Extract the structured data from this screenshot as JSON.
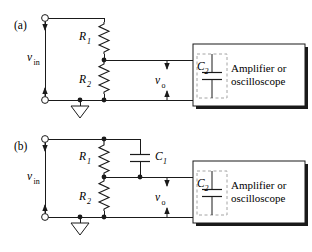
{
  "figure": {
    "background_color": "#ffffff",
    "line_color": "#1a1a1a",
    "dashed_color": "#9a9a9a"
  },
  "panels": [
    {
      "tag": "(a)",
      "description": "Resistive voltage divider feeding amplifier/oscilloscope with input capacitance C2",
      "input_label": "v",
      "input_sub": "in",
      "output_label": "v",
      "output_sub": "o",
      "resistors": [
        {
          "label": "R",
          "sub": "1"
        },
        {
          "label": "R",
          "sub": "2"
        }
      ],
      "capacitors": [
        {
          "label": "C",
          "sub": "2",
          "dashed": true
        }
      ],
      "instrument_line1": "Amplifier or",
      "instrument_line2": "oscilloscope",
      "ground": "ground-symbol"
    },
    {
      "tag": "(b)",
      "description": "Compensated voltage divider with C1 across R1 feeding amplifier/oscilloscope",
      "input_label": "v",
      "input_sub": "in",
      "output_label": "v",
      "output_sub": "o",
      "resistors": [
        {
          "label": "R",
          "sub": "1"
        },
        {
          "label": "R",
          "sub": "2"
        }
      ],
      "capacitors": [
        {
          "label": "C",
          "sub": "1",
          "dashed": false
        },
        {
          "label": "C",
          "sub": "2",
          "dashed": true
        }
      ],
      "instrument_line1": "Amplifier or",
      "instrument_line2": "oscilloscope",
      "ground": "ground-symbol"
    }
  ]
}
